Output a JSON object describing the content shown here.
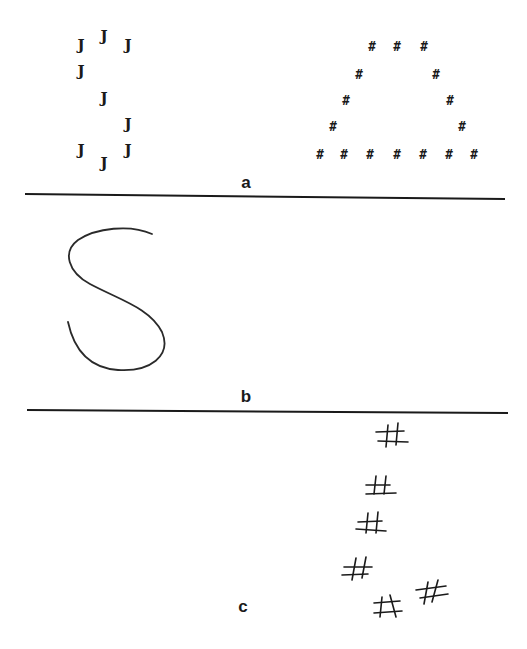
{
  "figure": {
    "panels": [
      {
        "label": "a",
        "description": "Global letter S composed of small J letters, and global letter A composed of small # symbols",
        "left_figure": {
          "global_shape": "S",
          "local_element": "J",
          "elements": [
            {
              "char": "J",
              "x": 81,
              "y": 45
            },
            {
              "char": "J",
              "x": 104,
              "y": 36
            },
            {
              "char": "J",
              "x": 128,
              "y": 45
            },
            {
              "char": "J",
              "x": 81,
              "y": 71
            },
            {
              "char": "J",
              "x": 104,
              "y": 98
            },
            {
              "char": "J",
              "x": 128,
              "y": 124
            },
            {
              "char": "J",
              "x": 81,
              "y": 150
            },
            {
              "char": "J",
              "x": 104,
              "y": 163
            },
            {
              "char": "J",
              "x": 128,
              "y": 150
            }
          ]
        },
        "right_figure": {
          "global_shape": "A",
          "local_element": "#",
          "elements": [
            {
              "char": "#",
              "x": 372,
              "y": 46
            },
            {
              "char": "#",
              "x": 397,
              "y": 46
            },
            {
              "char": "#",
              "x": 424,
              "y": 46
            },
            {
              "char": "#",
              "x": 359,
              "y": 74
            },
            {
              "char": "#",
              "x": 436,
              "y": 74
            },
            {
              "char": "#",
              "x": 346,
              "y": 100
            },
            {
              "char": "#",
              "x": 450,
              "y": 100
            },
            {
              "char": "#",
              "x": 333,
              "y": 126
            },
            {
              "char": "#",
              "x": 462,
              "y": 126
            },
            {
              "char": "#",
              "x": 320,
              "y": 154
            },
            {
              "char": "#",
              "x": 344,
              "y": 154
            },
            {
              "char": "#",
              "x": 370,
              "y": 154
            },
            {
              "char": "#",
              "x": 397,
              "y": 154
            },
            {
              "char": "#",
              "x": 423,
              "y": 154
            },
            {
              "char": "#",
              "x": 449,
              "y": 154
            },
            {
              "char": "#",
              "x": 474,
              "y": 154
            }
          ]
        },
        "label_pos": {
          "x": 246,
          "y": 175
        }
      },
      {
        "label": "b",
        "description": "Hand-drawn reproduction showing only the global S shape",
        "drawing": "hand-drawn S curve",
        "label_pos": {
          "x": 246,
          "y": 388
        }
      },
      {
        "label": "c",
        "description": "Hand-drawn reproduction showing only the local # elements, scattered",
        "elements": [
          {
            "char": "#",
            "x": 392,
            "y": 437
          },
          {
            "char": "#",
            "x": 380,
            "y": 488
          },
          {
            "char": "#",
            "x": 372,
            "y": 525
          },
          {
            "char": "#",
            "x": 358,
            "y": 570
          },
          {
            "char": "#",
            "x": 432,
            "y": 592
          },
          {
            "char": "#",
            "x": 388,
            "y": 607
          }
        ],
        "label_pos": {
          "x": 246,
          "y": 598
        }
      }
    ],
    "dividers": [
      {
        "x1": 25,
        "y1": 194,
        "x2": 505,
        "y2": 199
      },
      {
        "x1": 27,
        "y1": 410,
        "x2": 508,
        "y2": 413
      }
    ],
    "colors": {
      "ink": "#1a1a1a",
      "background": "#ffffff"
    }
  }
}
